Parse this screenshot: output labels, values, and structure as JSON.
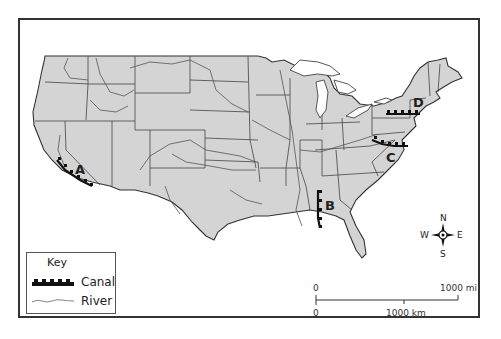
{
  "map": {
    "title": "",
    "region": "Contiguous United States",
    "fill_color": "#d4d4d4",
    "water_color": "#ffffff",
    "canals": [
      {
        "label": "A",
        "location": "California (Central Valley)"
      },
      {
        "label": "B",
        "location": "Alabama"
      },
      {
        "label": "C",
        "location": "Pennsylvania / Maryland"
      },
      {
        "label": "D",
        "location": "New York"
      }
    ]
  },
  "key": {
    "title": "Key",
    "items": [
      {
        "symbol": "canal-symbol",
        "label": "Canal"
      },
      {
        "symbol": "river-symbol",
        "label": "River"
      }
    ]
  },
  "scale": {
    "miles_start": "0",
    "miles_end": "1000 mi",
    "km_start": "0",
    "km_mid": "1000 km"
  },
  "compass": {
    "n": "N",
    "s": "S",
    "e": "E",
    "w": "W"
  }
}
